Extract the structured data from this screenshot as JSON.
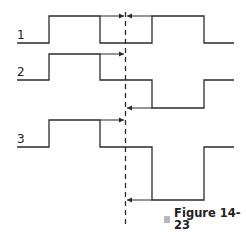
{
  "diagram": {
    "type": "timing-diagram",
    "signals": [
      {
        "label": "1",
        "levels": [
          "low",
          "high",
          "low",
          "high",
          "low"
        ]
      },
      {
        "label": "2",
        "levels": [
          "mid",
          "high",
          "mid",
          "low",
          "mid"
        ]
      },
      {
        "label": "3",
        "levels": [
          "mid",
          "high",
          "mid",
          "low",
          "mid"
        ]
      }
    ],
    "reference_line": "dashed vertical line with arrows indicating time delays",
    "caption": "Figure 14-23",
    "colors": {
      "line": "#2b2b2b",
      "caption_marker": "#b8b8b8"
    }
  }
}
